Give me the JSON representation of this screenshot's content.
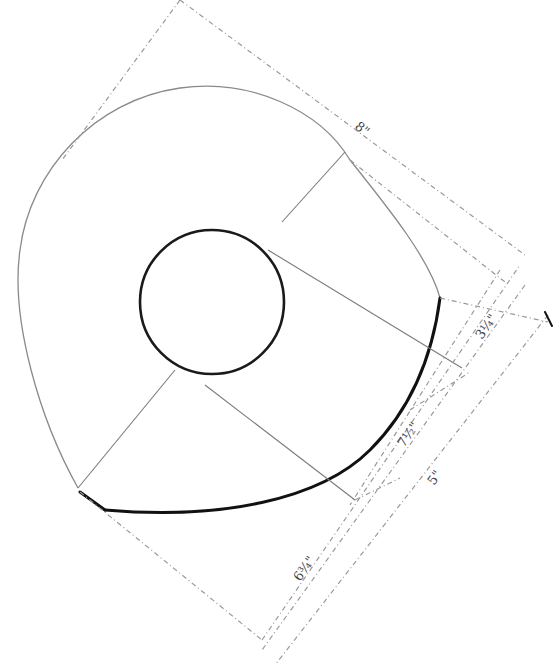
{
  "diagram": {
    "colors": {
      "background": "#ffffff",
      "outline": "#8a8a8a",
      "bold_edge": "#111111",
      "dimension_lines": "#9a9a9a",
      "text": "#444444"
    },
    "dimensions": [
      {
        "id": "top",
        "label": "8\""
      },
      {
        "id": "right-upper",
        "label": "3¼\""
      },
      {
        "id": "middle",
        "label": "7½\""
      },
      {
        "id": "right-lower",
        "label": "5\""
      },
      {
        "id": "bottom-left",
        "label": "6¾\""
      }
    ]
  }
}
